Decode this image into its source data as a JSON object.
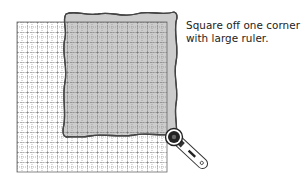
{
  "caption": {
    "line1": "Square off one corner",
    "line2": "with large ruler."
  },
  "diagram": {
    "grid": {
      "x": 17,
      "y": 22,
      "width": 150,
      "height": 150,
      "major_step": 10,
      "line_color": "#555555"
    },
    "fabric": {
      "fill": "#cccccc",
      "stroke": "#444444"
    },
    "tool": {
      "name": "rotary-cutter"
    }
  }
}
